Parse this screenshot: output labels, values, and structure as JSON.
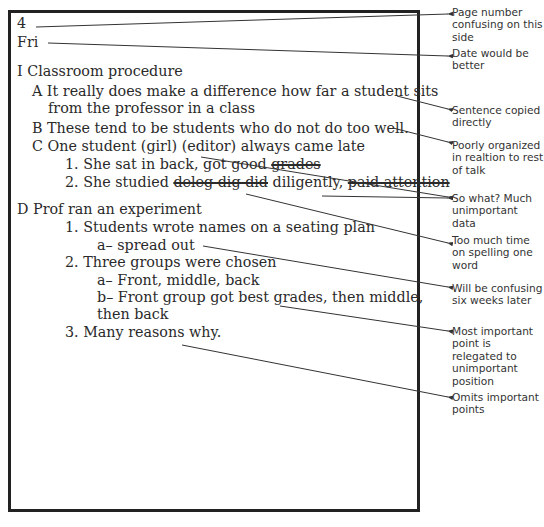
{
  "notes": {
    "page_number": "4",
    "day": "Fri",
    "lines": [
      {
        "id": "l1",
        "text": "I Classroom procedure"
      },
      {
        "id": "l2",
        "text": "A It really does make a difference how far a student sits"
      },
      {
        "id": "l3",
        "text": "from the  professor in a class"
      },
      {
        "id": "l4",
        "text": "B These tend to be students who do not do too well."
      },
      {
        "id": "l5",
        "text": "C One student (girl) (editor) always came late"
      },
      {
        "id": "l6a",
        "text": "1. She sat in back, got good "
      },
      {
        "id": "l6b",
        "text": "grades"
      },
      {
        "id": "l7a",
        "text": "2. She studied "
      },
      {
        "id": "l7b",
        "text": "deleg dig did"
      },
      {
        "id": "l7c",
        "text": " diligently, "
      },
      {
        "id": "l7d",
        "text": "paid attention"
      },
      {
        "id": "l8",
        "text": "D Prof ran an experiment"
      },
      {
        "id": "l9",
        "text": "1. Students wrote names on a seating plan"
      },
      {
        "id": "l10",
        "text": "a– spread out"
      },
      {
        "id": "l11",
        "text": "2. Three groups were chosen"
      },
      {
        "id": "l12",
        "text": "a– Front, middle, back"
      },
      {
        "id": "l13",
        "text": "b– Front group got best grades, then middle,"
      },
      {
        "id": "l14",
        "text": "then back"
      },
      {
        "id": "l15",
        "text": "3. Many reasons why."
      }
    ]
  },
  "annotations": [
    {
      "text": "Page number confusing on this side"
    },
    {
      "text": "Date would be better"
    },
    {
      "text": "Sentence copied directly"
    },
    {
      "text": "Poorly organized in realtion to rest of talk"
    },
    {
      "text": "So what? Much unimportant data"
    },
    {
      "text": "Too much time on spelling one word"
    },
    {
      "text": "Will be confusing six weeks later"
    },
    {
      "text": "Most important point is relegated to unimportant position"
    },
    {
      "text": "Omits important points"
    }
  ],
  "colors": {
    "ink": "#2a2a2a",
    "border": "#222222",
    "leader": "#333333"
  }
}
